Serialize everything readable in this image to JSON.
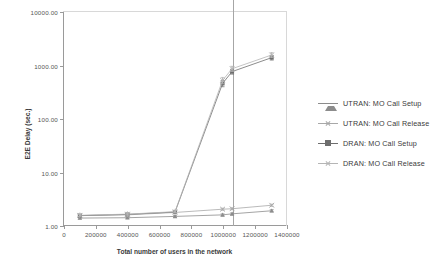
{
  "chart_data": {
    "type": "line",
    "title": "",
    "xlabel": "Total number of users in the network",
    "ylabel": "E2E Delay (sec.)",
    "yscale": "log",
    "xscale": "linear",
    "xlim": [
      0,
      1400000
    ],
    "ylim": [
      1,
      10000
    ],
    "grid": false,
    "legend_position": "right",
    "ytick_labels": [
      "1.00",
      "10.00",
      "100.00",
      "1000.00",
      "10000.00"
    ],
    "ytick_values": [
      1,
      10,
      100,
      1000,
      10000
    ],
    "xtick_labels": [
      "0",
      "200000",
      "400000",
      "600000",
      "800000",
      "1000000",
      "1200000",
      "1400000"
    ],
    "xtick_values": [
      0,
      200000,
      400000,
      600000,
      800000,
      1000000,
      1200000,
      1400000
    ],
    "annotations": [
      {
        "name": "capacity-reference-line",
        "type": "vline",
        "x": 1060000
      }
    ],
    "series": [
      {
        "name": "UTRAN: MO Call Setup",
        "marker": "triangle",
        "color": "#8c8c8c",
        "x": [
          100000,
          400000,
          700000,
          1000000,
          1060000,
          1310000
        ],
        "y": [
          1.35,
          1.37,
          1.45,
          1.55,
          1.62,
          1.85
        ],
        "yerr": [
          0.05,
          0.05,
          0.06,
          0.07,
          0.07,
          0.09
        ]
      },
      {
        "name": "UTRAN: MO Call Release",
        "marker": "x",
        "color": "#a8a8a8",
        "x": [
          100000,
          400000,
          700000,
          1000000,
          1060000,
          1310000
        ],
        "y": [
          1.5,
          1.55,
          1.72,
          1.98,
          2.02,
          2.35
        ],
        "yerr": [
          0.06,
          0.06,
          0.07,
          0.09,
          0.09,
          0.11
        ]
      },
      {
        "name": "DRAN: MO Call Setup",
        "marker": "square",
        "color": "#6e6e6e",
        "x": [
          100000,
          400000,
          700000,
          1000000,
          1060000,
          1310000
        ],
        "y": [
          1.5,
          1.58,
          1.75,
          455,
          760,
          1390
        ],
        "yerr": [
          0.06,
          0.06,
          0.07,
          60,
          80,
          140
        ]
      },
      {
        "name": "DRAN: MO Call Release",
        "marker": "star",
        "color": "#b5b5b5",
        "x": [
          100000,
          400000,
          700000,
          1000000,
          1060000,
          1310000
        ],
        "y": [
          1.52,
          1.6,
          1.78,
          520,
          860,
          1560
        ],
        "yerr": [
          0.06,
          0.06,
          0.07,
          70,
          95,
          160
        ]
      }
    ]
  },
  "legend": {
    "items": [
      {
        "label": "UTRAN: MO Call Setup",
        "marker": "triangle",
        "color": "#8c8c8c"
      },
      {
        "label": "UTRAN: MO Call Release",
        "marker": "x",
        "color": "#a8a8a8"
      },
      {
        "label": "DRAN: MO Call Setup",
        "marker": "square",
        "color": "#6e6e6e"
      },
      {
        "label": "DRAN: MO Call Release",
        "marker": "star",
        "color": "#b5b5b5"
      }
    ]
  },
  "colors": {
    "axis": "#9a9a9a",
    "text": "#3a3a3a",
    "tick_text": "#555555",
    "reference_line": "#a6a6a6",
    "background": "#ffffff"
  }
}
